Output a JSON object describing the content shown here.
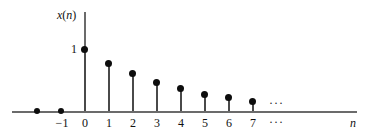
{
  "chart_data": {
    "type": "scatter",
    "plot_style": "stem",
    "title": "",
    "subtitle": "",
    "xlabel": "n",
    "ylabel": "x(n)",
    "grid": false,
    "legend": null,
    "xlim": [
      -2.9,
      11.5
    ],
    "ylim": [
      0,
      1.55
    ],
    "xticks": [
      -1,
      0,
      1,
      2,
      3,
      4,
      5,
      6,
      7
    ],
    "xticklabels": [
      "−1",
      "0",
      "1",
      "2",
      "3",
      "4",
      "5",
      "6",
      "7"
    ],
    "yticks": [
      1
    ],
    "yticklabels": [
      "1"
    ],
    "x": [
      -2,
      -1,
      0,
      1,
      2,
      3,
      4,
      5,
      6,
      7
    ],
    "values": [
      0,
      0,
      1,
      0.77,
      0.6,
      0.46,
      0.36,
      0.26,
      0.21,
      0.15
    ],
    "annotations": [
      {
        "text": "∙∙∙",
        "position": "above-axis-right"
      },
      {
        "text": "∙∙∙",
        "position": "below-axis-right"
      }
    ]
  },
  "axes": {
    "y_axis_label": "x(n)",
    "y_axis_label_var": "x",
    "y_axis_label_open": "(",
    "y_axis_label_arg": "n",
    "y_axis_label_close": ")",
    "x_axis_label": "n",
    "y_tick_one": "1"
  },
  "x_tick_labels": [
    {
      "text": "−1"
    },
    {
      "text": "0"
    },
    {
      "text": "1"
    },
    {
      "text": "2"
    },
    {
      "text": "3"
    },
    {
      "text": "4"
    },
    {
      "text": "5"
    },
    {
      "text": "6"
    },
    {
      "text": "7"
    }
  ],
  "ellipses": {
    "upper": "···",
    "lower": "···"
  },
  "colors": {
    "background": "#ffffff",
    "axis": "#6b6b6b",
    "stem": "#4a4a4a",
    "marker": "#0d0d0d",
    "text": "#111111"
  }
}
